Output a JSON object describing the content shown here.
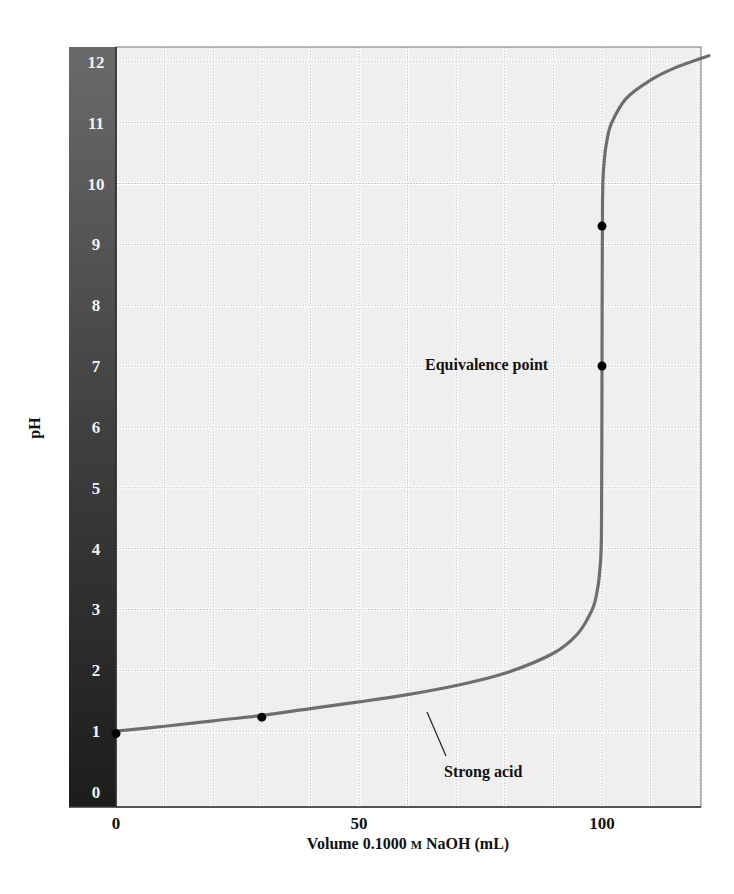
{
  "chart_data": {
    "type": "line",
    "title": "",
    "xlabel": "Volume 0.1000 M NaOH (mL)",
    "xlabel_parts": {
      "prefix": "Volume 0.1000 ",
      "unit_smallcaps": "M",
      "suffix": " NaOH (mL)"
    },
    "ylabel": "pH",
    "xlim": [
      0,
      122
    ],
    "ylim": [
      0,
      12.5
    ],
    "x_ticks": [
      0,
      50,
      100
    ],
    "x_tick_labels": [
      "0",
      "50",
      "100"
    ],
    "y_ticks": [
      0,
      1,
      2,
      3,
      4,
      5,
      6,
      7,
      8,
      9,
      10,
      11,
      12
    ],
    "y_tick_labels": [
      "0",
      "1",
      "2",
      "3",
      "4",
      "5",
      "6",
      "7",
      "8",
      "9",
      "10",
      "11",
      "12"
    ],
    "grid": {
      "x_step": 10,
      "y_step": 1,
      "on": true
    },
    "series": [
      {
        "name": "Strong acid",
        "x": [
          0,
          10,
          20,
          30,
          40,
          50,
          60,
          70,
          80,
          90,
          95,
          98,
          99,
          99.5,
          99.9,
          100,
          100.1,
          100.5,
          101,
          102,
          105,
          110,
          115,
          122
        ],
        "values": [
          1.0,
          1.08,
          1.17,
          1.26,
          1.37,
          1.48,
          1.6,
          1.75,
          1.95,
          2.28,
          2.6,
          3.0,
          3.3,
          3.6,
          4.3,
          7.0,
          9.7,
          10.4,
          10.7,
          11.0,
          11.4,
          11.7,
          11.9,
          12.1
        ]
      }
    ],
    "marked_points": [
      {
        "x": 0,
        "y": 0.96
      },
      {
        "x": 30,
        "y": 1.23
      },
      {
        "x": 100,
        "y": 7.0,
        "label": "Equivalence point"
      },
      {
        "x": 100,
        "y": 9.3
      }
    ],
    "annotations": [
      {
        "text": "Equivalence point",
        "x": 100,
        "y": 7.0
      },
      {
        "text": "Strong acid",
        "x": 70,
        "y": 1.5
      }
    ],
    "colors": {
      "curve": "#6e6e6e",
      "points": "#000000",
      "plot_bg": "#efefef",
      "grid_major": "#ffffff",
      "grid_minor": "#c6c6c6",
      "y_band_top": "#6a6a6a",
      "y_band_bottom": "#1c1c1c"
    }
  }
}
